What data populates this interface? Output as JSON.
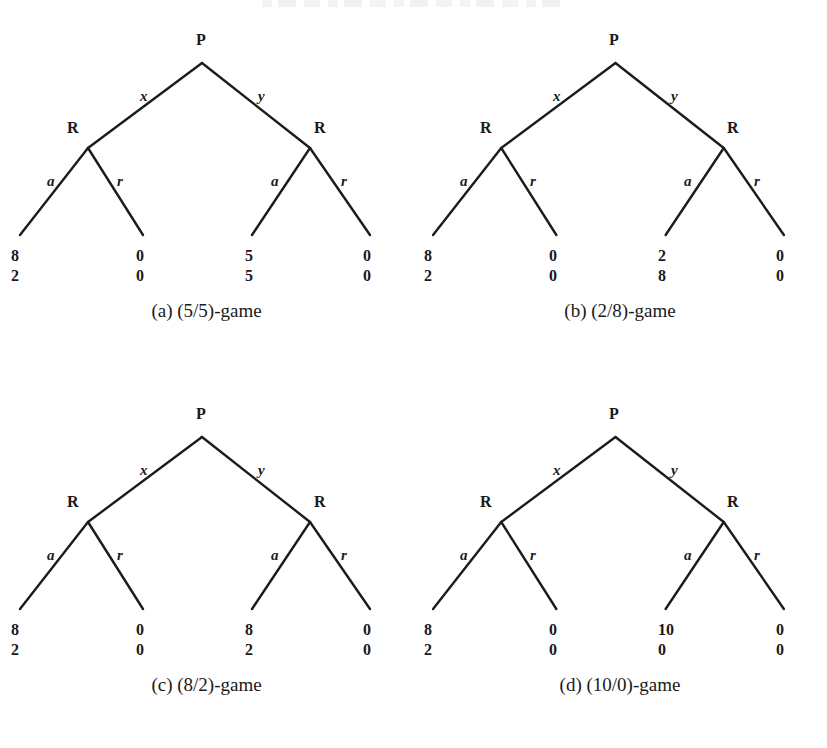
{
  "figure": {
    "node_player": "P",
    "node_responder": "R",
    "edge_left": "x",
    "edge_right": "y",
    "edge_accept": "a",
    "edge_reject": "r",
    "line_color": "#1c1c1c",
    "text_color": "#1a1a1a",
    "background": "#ffffff"
  },
  "panels": [
    {
      "id": "panel-a",
      "caption": "(a) (5/5)-game",
      "root": "P",
      "left_branch": "x",
      "right_branch": "y",
      "left_node": "R",
      "right_node": "R",
      "left_accept": "a",
      "left_reject": "r",
      "right_accept": "a",
      "right_reject": "r",
      "leaves": [
        {
          "name": "left-accept",
          "top": "8",
          "bottom": "2"
        },
        {
          "name": "left-reject",
          "top": "0",
          "bottom": "0"
        },
        {
          "name": "right-accept",
          "top": "5",
          "bottom": "5"
        },
        {
          "name": "right-reject",
          "top": "0",
          "bottom": "0"
        }
      ]
    },
    {
      "id": "panel-b",
      "caption": "(b) (2/8)-game",
      "root": "P",
      "left_branch": "x",
      "right_branch": "y",
      "left_node": "R",
      "right_node": "R",
      "left_accept": "a",
      "left_reject": "r",
      "right_accept": "a",
      "right_reject": "r",
      "leaves": [
        {
          "name": "left-accept",
          "top": "8",
          "bottom": "2"
        },
        {
          "name": "left-reject",
          "top": "0",
          "bottom": "0"
        },
        {
          "name": "right-accept",
          "top": "2",
          "bottom": "8"
        },
        {
          "name": "right-reject",
          "top": "0",
          "bottom": "0"
        }
      ]
    },
    {
      "id": "panel-c",
      "caption": "(c) (8/2)-game",
      "root": "P",
      "left_branch": "x",
      "right_branch": "y",
      "left_node": "R",
      "right_node": "R",
      "left_accept": "a",
      "left_reject": "r",
      "right_accept": "a",
      "right_reject": "r",
      "leaves": [
        {
          "name": "left-accept",
          "top": "8",
          "bottom": "2"
        },
        {
          "name": "left-reject",
          "top": "0",
          "bottom": "0"
        },
        {
          "name": "right-accept",
          "top": "8",
          "bottom": "2"
        },
        {
          "name": "right-reject",
          "top": "0",
          "bottom": "0"
        }
      ]
    },
    {
      "id": "panel-d",
      "caption": "(d) (10/0)-game",
      "root": "P",
      "left_branch": "x",
      "right_branch": "y",
      "left_node": "R",
      "right_node": "R",
      "left_accept": "a",
      "left_reject": "r",
      "right_accept": "a",
      "right_reject": "r",
      "leaves": [
        {
          "name": "left-accept",
          "top": "8",
          "bottom": "2"
        },
        {
          "name": "left-reject",
          "top": "0",
          "bottom": "0"
        },
        {
          "name": "right-accept",
          "top": "10",
          "bottom": "0"
        },
        {
          "name": "right-reject",
          "top": "0",
          "bottom": "0"
        }
      ]
    }
  ]
}
